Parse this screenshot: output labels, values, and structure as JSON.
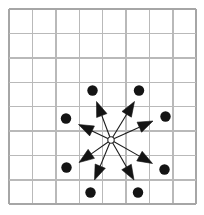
{
  "figure": {
    "colors": {
      "background": "#ffffff",
      "grid_line": "#b9b9b9",
      "grid_border": "#a6a6a6",
      "vector": "#141414",
      "origin_fill": "#ffffff",
      "origin_stroke": "#2a2a2a"
    }
  },
  "grid": {
    "columns": 8,
    "rows": 8,
    "left": 9,
    "top": 9,
    "cell_width": 23.4,
    "cell_height": 24.4
  },
  "chart_data": {
    "type": "scatter",
    "title": "",
    "xlabel": "",
    "ylabel": "",
    "grid": true,
    "legend_position": "none",
    "xlim": [
      0,
      8
    ],
    "ylim": [
      0,
      8
    ],
    "origin": {
      "x": 111,
      "y": 140,
      "radius": 3.2
    },
    "vectors": [
      {
        "name": "vector-up-left",
        "angle_deg": 115,
        "x1": 111,
        "y1": 140,
        "x2": 96.5,
        "y2": 101.5,
        "dot_x": 92.5,
        "dot_y": 90.5,
        "dot_r": 5.2,
        "head_len": 15,
        "head_w": 11
      },
      {
        "name": "vector-up-right",
        "angle_deg": 65,
        "x1": 111,
        "y1": 140,
        "x2": 134.5,
        "y2": 101.5,
        "dot_x": 139.0,
        "dot_y": 90.5,
        "dot_r": 5.2,
        "head_len": 15,
        "head_w": 11
      },
      {
        "name": "vector-left-upper",
        "angle_deg": 160,
        "x1": 111,
        "y1": 140,
        "x2": 78.5,
        "y2": 124.5,
        "dot_x": 66.0,
        "dot_y": 118.5,
        "dot_r": 5.2,
        "head_len": 15,
        "head_w": 11
      },
      {
        "name": "vector-right-upper",
        "angle_deg": 20,
        "x1": 111,
        "y1": 140,
        "x2": 153.0,
        "y2": 121.0,
        "dot_x": 165.5,
        "dot_y": 116.5,
        "dot_r": 5.2,
        "head_len": 15,
        "head_w": 11
      },
      {
        "name": "vector-left-lower",
        "angle_deg": 200,
        "x1": 111,
        "y1": 140,
        "x2": 79.0,
        "y2": 162.5,
        "dot_x": 66.5,
        "dot_y": 167.5,
        "dot_r": 5.2,
        "head_len": 15,
        "head_w": 11
      },
      {
        "name": "vector-right-lower",
        "angle_deg": 340,
        "x1": 111,
        "y1": 140,
        "x2": 152.5,
        "y2": 163.5,
        "dot_x": 164.5,
        "dot_y": 169.5,
        "dot_r": 5.2,
        "head_len": 15,
        "head_w": 11
      },
      {
        "name": "vector-down-left",
        "angle_deg": 248,
        "x1": 111,
        "y1": 140,
        "x2": 94.5,
        "y2": 180.0,
        "dot_x": 90.5,
        "dot_y": 192.5,
        "dot_r": 5.2,
        "head_len": 15,
        "head_w": 11
      },
      {
        "name": "vector-down-right",
        "angle_deg": 292,
        "x1": 111,
        "y1": 140,
        "x2": 134.0,
        "y2": 180.0,
        "dot_x": 138.0,
        "dot_y": 192.5,
        "dot_r": 5.2,
        "head_len": 15,
        "head_w": 11
      }
    ]
  }
}
